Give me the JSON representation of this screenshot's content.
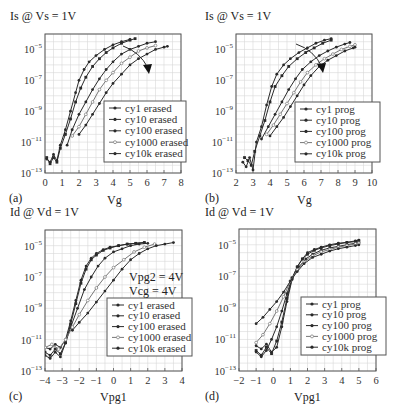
{
  "chart_data": [
    {
      "panel": "(a)",
      "type": "line",
      "title": "Is @ Vs = 1V",
      "xlabel": "Vg",
      "ylabel": "Is @ Vs = 1V",
      "yscale": "log",
      "xlim": [
        0,
        8
      ],
      "ylim_exp": [
        -13,
        -4
      ],
      "xticks": [
        "0",
        "1",
        "2",
        "3",
        "4",
        "5",
        "6",
        "7",
        "8"
      ],
      "yticks": [
        "10^-5",
        "10^-7",
        "10^-9",
        "10^-11",
        "10^-13"
      ],
      "grid": true,
      "legend_position": "lower right",
      "arrow": "increasing cycles shifts curves right",
      "series": [
        {
          "name": "cy1 erased",
          "x": [
            0.1,
            0.3,
            0.5,
            0.7,
            0.9,
            1.2,
            1.5,
            1.8,
            2.0,
            2.3,
            2.6,
            3.0,
            3.5,
            4.0,
            4.5,
            5.0
          ],
          "y_exp": [
            -12.1,
            -12.3,
            -11.8,
            -12.2,
            -11.2,
            -10.2,
            -9.0,
            -7.8,
            -7.0,
            -6.3,
            -5.8,
            -5.4,
            -5.0,
            -4.7,
            -4.5,
            -4.35
          ]
        },
        {
          "name": "cy10 erased",
          "x": [
            0.1,
            0.3,
            0.5,
            0.7,
            0.9,
            1.2,
            1.5,
            1.8,
            2.1,
            2.4,
            2.8,
            3.2,
            3.6,
            4.0,
            4.5,
            5.0,
            5.3
          ],
          "y_exp": [
            -12.0,
            -12.4,
            -12.0,
            -12.3,
            -11.4,
            -10.5,
            -9.5,
            -8.4,
            -7.5,
            -6.8,
            -6.1,
            -5.6,
            -5.2,
            -4.9,
            -4.6,
            -4.4,
            -4.3
          ]
        },
        {
          "name": "cy100 erased",
          "x": [
            1.3,
            1.6,
            2.0,
            2.4,
            2.8,
            3.2,
            3.6,
            4.0,
            4.5,
            5.0,
            5.5,
            6.0,
            6.5
          ],
          "y_exp": [
            -11.2,
            -10.2,
            -9.2,
            -8.4,
            -7.6,
            -6.9,
            -6.3,
            -5.8,
            -5.3,
            -5.0,
            -4.8,
            -4.6,
            -4.5
          ]
        },
        {
          "name": "cy1000 erased",
          "x": [
            1.6,
            2.0,
            2.4,
            2.8,
            3.2,
            3.6,
            4.0,
            4.5,
            5.0,
            5.5,
            6.0,
            6.5
          ],
          "y_exp": [
            -10.6,
            -10.0,
            -9.2,
            -8.4,
            -7.6,
            -7.0,
            -6.5,
            -5.9,
            -5.5,
            -5.1,
            -4.9,
            -4.75
          ]
        },
        {
          "name": "cy10k erased",
          "x": [
            2.0,
            2.4,
            2.8,
            3.2,
            3.6,
            4.0,
            4.5,
            5.0,
            5.5,
            6.0,
            6.5,
            7.0,
            7.2
          ],
          "y_exp": [
            -10.5,
            -9.9,
            -9.2,
            -8.5,
            -7.8,
            -7.2,
            -6.6,
            -6.0,
            -5.6,
            -5.3,
            -5.0,
            -4.85,
            -4.8
          ]
        }
      ]
    },
    {
      "panel": "(b)",
      "type": "line",
      "title": "Is @ Vs = 1V",
      "xlabel": "Vg",
      "ylabel": "Is @ Vs = 1V",
      "yscale": "log",
      "xlim": [
        2,
        10
      ],
      "ylim_exp": [
        -13,
        -4
      ],
      "xticks": [
        "2",
        "3",
        "4",
        "5",
        "6",
        "7",
        "8",
        "9",
        "10"
      ],
      "yticks": [
        "10^-5",
        "10^-7",
        "10^-9",
        "10^-11",
        "10^-13"
      ],
      "grid": true,
      "legend_position": "lower right",
      "arrow": "increasing cycles shifts curves right",
      "series": [
        {
          "name": "cy1 prog",
          "x": [
            2.4,
            2.6,
            2.8,
            3.0,
            3.2,
            3.5,
            3.8,
            4.1,
            4.4,
            4.8,
            5.2,
            5.7,
            6.2,
            6.7,
            7.2,
            7.6
          ],
          "y_exp": [
            -12.3,
            -12.6,
            -12.0,
            -12.8,
            -11.0,
            -10.0,
            -8.6,
            -7.4,
            -6.6,
            -6.0,
            -5.6,
            -5.2,
            -4.9,
            -4.6,
            -4.4,
            -4.3
          ]
        },
        {
          "name": "cy10 prog",
          "x": [
            2.5,
            2.7,
            2.9,
            3.1,
            3.4,
            3.7,
            4.0,
            4.3,
            4.7,
            5.1,
            5.6,
            6.1,
            6.6,
            7.1,
            7.6
          ],
          "y_exp": [
            -12.0,
            -12.2,
            -12.5,
            -11.6,
            -10.6,
            -9.6,
            -8.4,
            -7.4,
            -6.7,
            -6.1,
            -5.6,
            -5.2,
            -4.9,
            -4.6,
            -4.4
          ]
        },
        {
          "name": "cy100 prog",
          "x": [
            3.5,
            3.9,
            4.3,
            4.7,
            5.1,
            5.5,
            5.9,
            6.4,
            6.9,
            7.4,
            7.9,
            8.4,
            8.7
          ],
          "y_exp": [
            -10.8,
            -10.0,
            -9.2,
            -8.4,
            -7.6,
            -6.9,
            -6.3,
            -5.8,
            -5.4,
            -5.1,
            -4.85,
            -4.65,
            -4.55
          ]
        },
        {
          "name": "cy1000 prog",
          "x": [
            3.8,
            4.2,
            4.6,
            5.0,
            5.4,
            5.8,
            6.2,
            6.7,
            7.2,
            7.7,
            8.2,
            8.7,
            9.0
          ],
          "y_exp": [
            -10.5,
            -9.9,
            -9.2,
            -8.5,
            -7.8,
            -7.1,
            -6.5,
            -6.0,
            -5.6,
            -5.3,
            -5.0,
            -4.8,
            -4.7
          ]
        },
        {
          "name": "cy10k prog",
          "x": [
            4.0,
            4.4,
            4.8,
            5.2,
            5.6,
            6.0,
            6.4,
            6.9,
            7.4,
            7.9,
            8.4,
            8.9,
            9.0
          ],
          "y_exp": [
            -10.6,
            -10.0,
            -9.4,
            -8.7,
            -8.0,
            -7.3,
            -6.7,
            -6.1,
            -5.7,
            -5.4,
            -5.1,
            -4.9,
            -4.85
          ]
        }
      ]
    },
    {
      "panel": "(c)",
      "type": "line",
      "title": "Id @ Vd = 1V",
      "xlabel": "Vpg1",
      "ylabel": "Id @ Vd = 1V",
      "yscale": "log",
      "xlim": [
        -4,
        4
      ],
      "ylim_exp": [
        -13,
        -4
      ],
      "xticks": [
        "-4",
        "-3",
        "-2",
        "-1",
        "0",
        "1",
        "2",
        "3",
        "4"
      ],
      "yticks": [
        "10^-5",
        "10^-7",
        "10^-9",
        "10^-11",
        "10^-13"
      ],
      "grid": true,
      "legend_position": "lower right",
      "annotations": [
        "Vpg2 = 4V",
        "Vcg = 4V"
      ],
      "series": [
        {
          "name": "cy1 erased",
          "x": [
            -4.0,
            -3.7,
            -3.4,
            -3.1,
            -2.8,
            -2.5,
            -2.2,
            -1.9,
            -1.6,
            -1.3,
            -1.0,
            -0.6,
            -0.2,
            0.3,
            0.8,
            1.3,
            1.8
          ],
          "y_exp": [
            -11.5,
            -11.6,
            -11.3,
            -11.5,
            -11.0,
            -9.8,
            -8.5,
            -7.2,
            -6.3,
            -5.8,
            -5.5,
            -5.25,
            -5.1,
            -5.0,
            -4.9,
            -4.85,
            -4.8
          ]
        },
        {
          "name": "cy10 erased",
          "x": [
            -4.0,
            -3.7,
            -3.4,
            -3.1,
            -2.8,
            -2.5,
            -2.2,
            -1.9,
            -1.6,
            -1.3,
            -1.0,
            -0.6,
            -0.2,
            0.3,
            0.8,
            1.3,
            1.8
          ],
          "y_exp": [
            -11.8,
            -12.0,
            -11.6,
            -11.9,
            -11.2,
            -10.0,
            -8.7,
            -7.4,
            -6.5,
            -5.9,
            -5.6,
            -5.3,
            -5.15,
            -5.0,
            -4.9,
            -4.85,
            -4.8
          ]
        },
        {
          "name": "cy100 erased",
          "x": [
            -4.0,
            -3.7,
            -3.4,
            -3.1,
            -2.8,
            -2.5,
            -2.1,
            -1.7,
            -1.3,
            -0.9,
            -0.5,
            0.0,
            0.5,
            1.0,
            1.5,
            2.0
          ],
          "y_exp": [
            -12.0,
            -12.2,
            -11.8,
            -12.1,
            -11.2,
            -10.2,
            -9.0,
            -7.8,
            -7.0,
            -6.3,
            -5.8,
            -5.4,
            -5.2,
            -5.0,
            -4.9,
            -4.85
          ]
        },
        {
          "name": "cy1000 erased",
          "x": [
            -4.0,
            -3.6,
            -3.2,
            -2.8,
            -2.4,
            -2.0,
            -1.5,
            -1.0,
            -0.5,
            0.0,
            0.6,
            1.2,
            1.8,
            2.4
          ],
          "y_exp": [
            -11.5,
            -11.3,
            -11.6,
            -11.0,
            -10.2,
            -9.4,
            -8.5,
            -7.7,
            -7.0,
            -6.4,
            -5.9,
            -5.4,
            -5.1,
            -4.9
          ]
        },
        {
          "name": "cy10k erased",
          "x": [
            -2.4,
            -2.0,
            -1.5,
            -1.0,
            -0.5,
            0.0,
            0.5,
            1.0,
            1.5,
            2.0,
            2.5,
            3.0,
            3.5
          ],
          "y_exp": [
            -10.4,
            -9.9,
            -9.3,
            -8.6,
            -7.9,
            -7.2,
            -6.5,
            -5.9,
            -5.5,
            -5.2,
            -5.0,
            -4.9,
            -4.8
          ]
        }
      ]
    },
    {
      "panel": "(d)",
      "type": "line",
      "title": "Id @ Vd = 1V",
      "xlabel": "Vpg1",
      "ylabel": "Id @ Vd = 1V",
      "yscale": "log",
      "xlim": [
        -2,
        6
      ],
      "ylim_exp": [
        -13,
        -4
      ],
      "xticks": [
        "-2",
        "-1",
        "0",
        "1",
        "2",
        "3",
        "4",
        "5",
        "6"
      ],
      "yticks": [
        "10^-5",
        "10^-7",
        "10^-9",
        "10^-11",
        "10^-13"
      ],
      "grid": true,
      "legend_position": "lower right",
      "series": [
        {
          "name": "cy1 prog",
          "x": [
            -1.0,
            -0.7,
            -0.4,
            -0.1,
            0.2,
            0.5,
            0.8,
            1.1,
            1.4,
            1.7,
            2.0,
            2.4,
            2.8,
            3.3,
            3.8,
            4.3,
            4.8,
            5.0
          ],
          "y_exp": [
            -11.4,
            -11.6,
            -11.3,
            -11.8,
            -11.5,
            -10.2,
            -8.6,
            -7.2,
            -6.4,
            -5.9,
            -5.5,
            -5.3,
            -5.15,
            -5.0,
            -4.9,
            -4.85,
            -4.75,
            -4.7
          ]
        },
        {
          "name": "cy10 prog",
          "x": [
            -1.0,
            -0.7,
            -0.4,
            -0.1,
            0.2,
            0.5,
            0.8,
            1.1,
            1.4,
            1.7,
            2.0,
            2.4,
            2.8,
            3.3,
            3.8,
            4.3,
            4.8,
            5.0
          ],
          "y_exp": [
            -11.7,
            -12.0,
            -11.5,
            -11.9,
            -11.1,
            -9.9,
            -8.4,
            -7.1,
            -6.4,
            -5.9,
            -5.6,
            -5.35,
            -5.2,
            -5.05,
            -4.95,
            -4.85,
            -4.8,
            -4.75
          ]
        },
        {
          "name": "cy100 prog",
          "x": [
            -1.0,
            -0.7,
            -0.4,
            -0.1,
            0.2,
            0.5,
            0.8,
            1.1,
            1.5,
            1.9,
            2.3,
            2.8,
            3.3,
            3.8,
            4.3,
            4.8,
            5.0
          ],
          "y_exp": [
            -11.8,
            -12.1,
            -11.7,
            -11.0,
            -10.2,
            -9.2,
            -8.1,
            -7.1,
            -6.4,
            -5.9,
            -5.6,
            -5.35,
            -5.2,
            -5.1,
            -5.0,
            -4.9,
            -4.85
          ]
        },
        {
          "name": "cy1000 prog",
          "x": [
            -1.0,
            -0.6,
            -0.2,
            0.2,
            0.6,
            1.0,
            1.4,
            1.8,
            2.3,
            2.8,
            3.3,
            3.8,
            4.3,
            4.8,
            5.0
          ],
          "y_exp": [
            -11.2,
            -10.7,
            -10.0,
            -9.2,
            -8.3,
            -7.3,
            -6.6,
            -6.1,
            -5.7,
            -5.45,
            -5.3,
            -5.15,
            -5.05,
            -4.95,
            -4.9
          ]
        },
        {
          "name": "cy10k prog",
          "x": [
            -1.0,
            -0.6,
            -0.2,
            0.2,
            0.6,
            1.0,
            1.4,
            1.8,
            2.3,
            2.8,
            3.3,
            3.8,
            4.3,
            4.8,
            5.0
          ],
          "y_exp": [
            -10.0,
            -9.6,
            -9.1,
            -8.6,
            -8.0,
            -7.3,
            -6.7,
            -6.2,
            -5.8,
            -5.6,
            -5.4,
            -5.25,
            -5.15,
            -5.05,
            -5.0
          ]
        }
      ]
    }
  ],
  "labels": {
    "a": {
      "title": "Is @ Vs = 1V",
      "panel": "(a)",
      "xlabel": "Vg"
    },
    "b": {
      "title": "Is @ Vs = 1V",
      "panel": "(b)",
      "xlabel": "Vg"
    },
    "c": {
      "title": "Id @ Vd = 1V",
      "panel": "(c)",
      "xlabel": "Vpg1",
      "note1": "Vpg2 = 4V",
      "note2": "Vcg = 4V"
    },
    "d": {
      "title": "Id @ Vd = 1V",
      "panel": "(d)",
      "xlabel": "Vpg1"
    }
  },
  "colors": {
    "line": "#2a2a2a",
    "grid": "#d8d8d8",
    "frame": "#555555",
    "open_marker": "#888888"
  }
}
